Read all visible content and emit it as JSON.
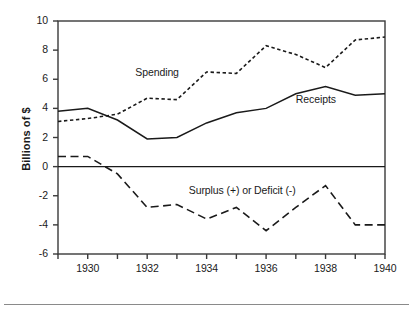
{
  "chart_data": {
    "type": "line",
    "title": "",
    "xlabel": "",
    "ylabel": "Billions of $",
    "xlim": [
      1929,
      1940
    ],
    "ylim": [
      -6,
      10
    ],
    "grid": false,
    "legend_position": "inline-annotations",
    "x": [
      1929,
      1930,
      1931,
      1932,
      1933,
      1934,
      1935,
      1936,
      1937,
      1938,
      1939,
      1940
    ],
    "x_tick_values": [
      1929,
      1930,
      1931,
      1932,
      1933,
      1934,
      1935,
      1936,
      1937,
      1938,
      1939,
      1940
    ],
    "x_tick_labels": [
      "",
      "1930",
      "",
      "1932",
      "",
      "1934",
      "",
      "1936",
      "",
      "1938",
      "",
      "1940"
    ],
    "y_ticks": [
      -6,
      -4,
      -2,
      0,
      2,
      4,
      6,
      8,
      10
    ],
    "y_tick_labels": [
      "-6",
      "-4",
      "-2",
      "0",
      "2",
      "4",
      "6",
      "8",
      "10"
    ],
    "series": [
      {
        "name": "Receipts",
        "style": "solid",
        "color": "#1a1a1a",
        "values": [
          3.8,
          4.0,
          3.2,
          1.9,
          2.0,
          3.0,
          3.7,
          4.0,
          5.0,
          5.5,
          4.9,
          5.0
        ]
      },
      {
        "name": "Spending",
        "style": "dotted",
        "color": "#1a1a1a",
        "values": [
          3.1,
          3.3,
          3.6,
          4.7,
          4.6,
          6.5,
          6.4,
          8.3,
          7.7,
          6.8,
          8.7,
          8.9
        ]
      },
      {
        "name": "Surplus (+) or Deficit (-)",
        "style": "dashed",
        "color": "#1a1a1a",
        "values": [
          0.7,
          0.7,
          -0.5,
          -2.8,
          -2.6,
          -3.6,
          -2.8,
          -4.4,
          -2.8,
          -1.3,
          -4.0,
          -4.0
        ]
      }
    ],
    "annotations": [
      {
        "text": "Spending",
        "x": 1931.6,
        "y": 6.4
      },
      {
        "text": "Receipts",
        "x": 1937.0,
        "y": 4.6
      },
      {
        "text": "Surplus (+) or Deficit (-)",
        "x": 1933.4,
        "y": -1.65
      }
    ],
    "zero_line": 0,
    "colors": {
      "ink": "#1a1a1a",
      "frame": "#3a3a3a",
      "rule": "#8a8a8a"
    }
  }
}
